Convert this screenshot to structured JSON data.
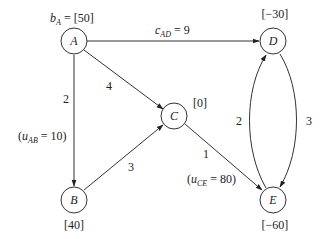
{
  "diagram": {
    "type": "network-flow-graph",
    "nodes": [
      {
        "id": "A",
        "label": "A",
        "supply_text": "[50]",
        "supply_prefix": "b",
        "supply_prefix_sub": "A",
        "supply": 50
      },
      {
        "id": "B",
        "label": "B",
        "supply_text": "[40]",
        "supply": 40
      },
      {
        "id": "C",
        "label": "C",
        "supply_text": "[0]",
        "supply": 0
      },
      {
        "id": "D",
        "label": "D",
        "supply_text": "[−30]",
        "supply": -30
      },
      {
        "id": "E",
        "label": "E",
        "supply_text": "[−60]",
        "supply": -60
      }
    ],
    "edges": [
      {
        "from": "A",
        "to": "D",
        "cost": 9,
        "cost_text": "9",
        "cost_prefix": "c",
        "cost_prefix_sub": "AD"
      },
      {
        "from": "A",
        "to": "C",
        "cost": 4,
        "cost_text": "4"
      },
      {
        "from": "A",
        "to": "B",
        "cost": 2,
        "cost_text": "2",
        "capacity": 10,
        "capacity_prefix": "u",
        "capacity_sub": "AB",
        "capacity_value": "10"
      },
      {
        "from": "B",
        "to": "C",
        "cost": 3,
        "cost_text": "3"
      },
      {
        "from": "C",
        "to": "E",
        "cost": 1,
        "cost_text": "1",
        "capacity": 80,
        "capacity_prefix": "u",
        "capacity_sub": "CE",
        "capacity_value": "80"
      },
      {
        "from": "E",
        "to": "D",
        "cost": 2,
        "cost_text": "2"
      },
      {
        "from": "D",
        "to": "E",
        "cost": 3,
        "cost_text": "3"
      }
    ],
    "symbols": {
      "equals": " = ",
      "open_paren": "(",
      "close_paren": ")",
      "open_bracket": "[",
      "close_bracket": "]"
    }
  }
}
